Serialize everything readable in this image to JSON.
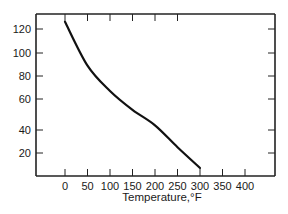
{
  "chart_data": {
    "type": "line",
    "title": "",
    "xlabel": "Temperature,°F",
    "ylabel": "",
    "xlim": [
      -65,
      465
    ],
    "x_ticks": [
      0,
      50,
      100,
      150,
      200,
      250,
      300,
      350,
      400
    ],
    "y_ticks": [
      20,
      40,
      60,
      80,
      100,
      120
    ],
    "y_tick_pixels": {
      "120": 29,
      "100": 53,
      "80": 76,
      "60": 99,
      "40": 130,
      "20": 153
    },
    "grid": false,
    "legend": null,
    "series": [
      {
        "name": "curve",
        "x": [
          0,
          50,
          100,
          150,
          200,
          250,
          300
        ],
        "y": [
          126,
          89,
          67,
          53,
          43,
          25,
          7
        ]
      }
    ]
  },
  "colors": {
    "line": "#111111",
    "axis": "#222222",
    "background": "#ffffff"
  }
}
